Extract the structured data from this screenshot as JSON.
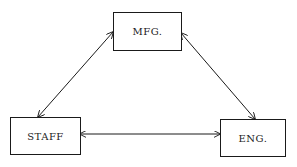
{
  "diagram": {
    "nodes": [
      {
        "id": "mfg",
        "label": "MFG."
      },
      {
        "id": "staff",
        "label": "STAFF"
      },
      {
        "id": "eng",
        "label": "ENG."
      }
    ],
    "edges": [
      {
        "from": "mfg",
        "to": "staff",
        "type": "bidirectional"
      },
      {
        "from": "mfg",
        "to": "eng",
        "type": "bidirectional"
      },
      {
        "from": "staff",
        "to": "eng",
        "type": "bidirectional"
      }
    ],
    "colors": {
      "stroke": "#1a1a1a",
      "background": "#ffffff"
    }
  }
}
